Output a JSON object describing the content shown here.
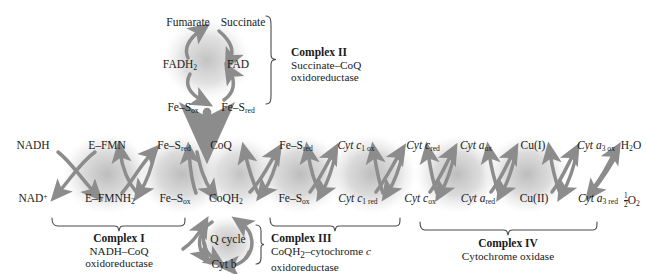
{
  "diagram": {
    "type": "biochemical-pathway",
    "accent_shade": "#c8c8c8",
    "arrow_color": "#8a8a8a",
    "text_color": "#1a1a1a"
  },
  "complex2": {
    "inputs": {
      "substrate": "Succinate",
      "product": "Fumarate"
    },
    "carriers": {
      "oxidized": "FAD",
      "reduced": "FADH",
      "reduced_sub": "2"
    },
    "iron_sulfur": {
      "ox": "Fe–S",
      "ox_sub": "ox",
      "red": "Fe–S",
      "red_sub": "red"
    },
    "caption_title": "Complex II",
    "caption_line1": "Succinate–CoQ",
    "caption_line2": "oxidoreductase"
  },
  "chain": {
    "nodes": [
      {
        "top": "NADH",
        "bottom": "NAD",
        "bottom_sup": "+"
      },
      {
        "top": "E–FMN",
        "bottom": "E–FMNH",
        "bottom_sub": "2"
      },
      {
        "top": "Fe–S",
        "top_sub": "red",
        "bottom": "Fe–S",
        "bottom_sub": "ox"
      },
      {
        "top": "CoQ",
        "bottom": "CoQH",
        "bottom_sub": "2"
      },
      {
        "top": "Fe–S",
        "top_sub": "red",
        "bottom": "Fe–S",
        "bottom_sub": "ox"
      },
      {
        "top": "Cyt c",
        "top_sub": "1 ox",
        "bottom": "Cyt c",
        "bottom_sub": "1 red"
      },
      {
        "top": "Cyt c",
        "top_sub": "red",
        "bottom": "Cyt c",
        "bottom_sub": "ox"
      },
      {
        "top": "Cyt a",
        "top_sub": "ox",
        "bottom": "Cyt a",
        "bottom_sub": "red"
      },
      {
        "top": "Cu(I)",
        "bottom": "Cu(II)"
      },
      {
        "top": "Cyt a",
        "top_sub": "3 ox",
        "bottom": "Cyt a",
        "bottom_sub": "3 red"
      },
      {
        "top": "H",
        "top_sub": "2",
        "top_tail": "O",
        "bottom": "O",
        "bottom_sub": "2",
        "bottom_frac_n": "1",
        "bottom_frac_d": "2"
      }
    ]
  },
  "qcycle": {
    "label": "Q cycle",
    "cytb": "Cyt b"
  },
  "captions": {
    "complex1": {
      "title": "Complex I",
      "line1": "NADH–CoQ",
      "line2": "oxidoreductase"
    },
    "complex3": {
      "title": "Complex III",
      "line1_a": "CoQH",
      "line1_sub": "2",
      "line1_b": "–cytochrome ",
      "line1_it": "c",
      "line2": "oxidoreductase"
    },
    "complex4": {
      "title": "Complex IV",
      "line1": "Cytochrome oxidase"
    }
  }
}
